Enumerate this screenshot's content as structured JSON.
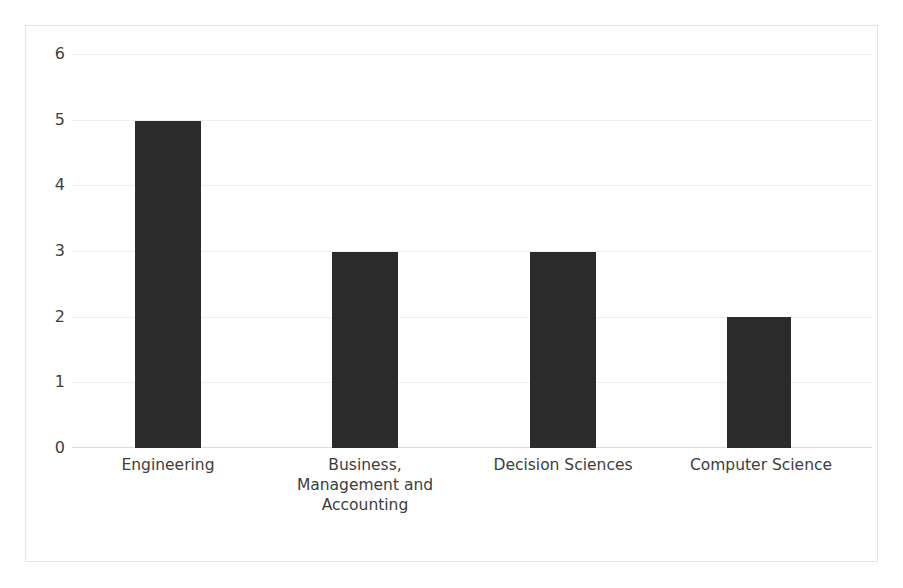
{
  "chart_data": {
    "type": "bar",
    "title": "",
    "subtitle": "",
    "xlabel": "",
    "ylabel": "",
    "categories": [
      "Engineering",
      "Business, Management and Accounting",
      "Decision Sciences",
      "Computer Science"
    ],
    "values": [
      5,
      3,
      3,
      2
    ],
    "ylim": [
      0,
      6
    ],
    "yticks": [
      "0",
      "1",
      "2",
      "3",
      "4",
      "5",
      "6"
    ],
    "ytick_values": [
      0,
      1,
      2,
      3,
      4,
      5,
      6
    ],
    "grid": true,
    "grid_axis": "y",
    "legend": null,
    "legend_position": "none",
    "bar_color": "#2b2b2b",
    "gridline_color": "#f0f0f0",
    "axis_line_color": "#dcdcdc",
    "frame_color": "#e3e3e3",
    "background_color": "#ffffff",
    "tick_label_color": "#3f3f3f",
    "category_label_color": "#3d3d3d",
    "annotations": []
  }
}
